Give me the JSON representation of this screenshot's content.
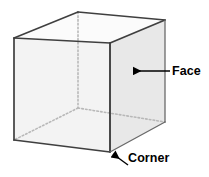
{
  "diagram": {
    "shape": "cube",
    "colors": {
      "background": "#ffffff",
      "edge_solid": "#3a3a3a",
      "edge_hidden": "#b4b4b4",
      "face_front": "#f2f2f2",
      "face_right": "#e6e6e6",
      "face_top": "#fafafa",
      "face_floor": "#c9c9c9",
      "label_text": "#000000",
      "arrow": "#000000"
    },
    "vertices": {
      "front_top_left": {
        "x": 14,
        "y": 38
      },
      "front_top_right": {
        "x": 110,
        "y": 43
      },
      "front_bottom_left": {
        "x": 14,
        "y": 140
      },
      "front_bottom_right": {
        "x": 110,
        "y": 152
      },
      "back_top_left": {
        "x": 78,
        "y": 12
      },
      "back_top_right": {
        "x": 165,
        "y": 20
      },
      "back_bottom_left": {
        "x": 78,
        "y": 108
      },
      "back_bottom_right": {
        "x": 165,
        "y": 122
      }
    },
    "hidden_edges": [
      "back_top_left-back_bottom_left",
      "back_bottom_left-front_bottom_left",
      "back_bottom_left-back_bottom_right"
    ],
    "annotations": [
      {
        "id": "face",
        "label": "Face",
        "arrow_style": "horizontal",
        "arrow_from": {
          "x": 170,
          "y": 71
        },
        "arrow_to": {
          "x": 132,
          "y": 71
        },
        "label_position": {
          "x": 172,
          "y": 65
        }
      },
      {
        "id": "corner",
        "label": "Corner",
        "arrow_style": "diagonal",
        "arrow_from": {
          "x": 128,
          "y": 164
        },
        "arrow_to": {
          "x": 112,
          "y": 153
        },
        "label_position": {
          "x": 128,
          "y": 152
        }
      }
    ]
  }
}
